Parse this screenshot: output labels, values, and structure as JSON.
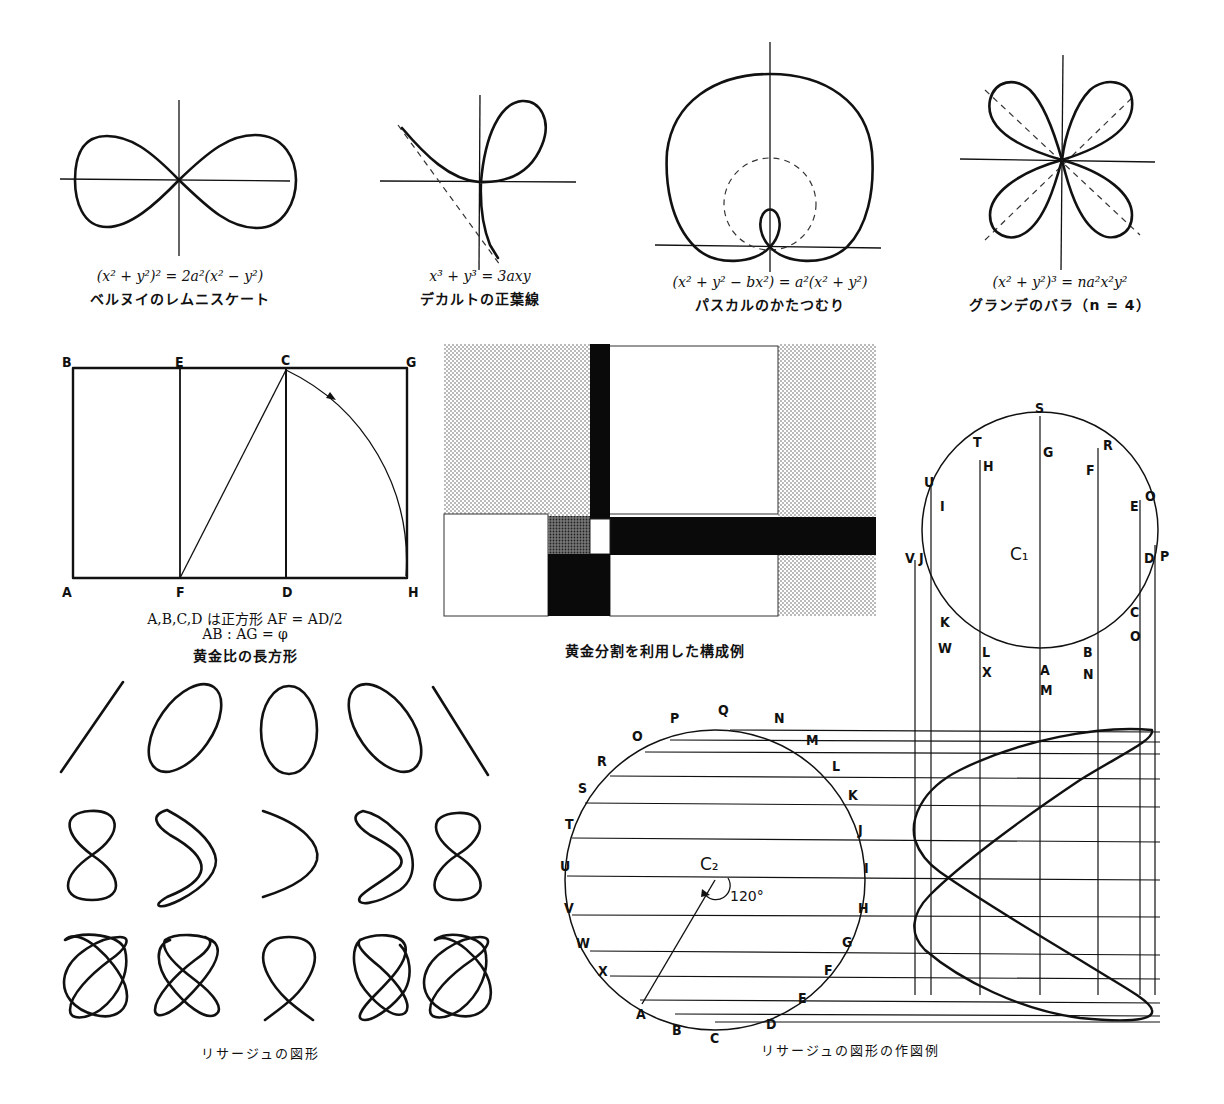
{
  "header": {
    "title_partial": ""
  },
  "curves": [
    {
      "id": "lemniscate",
      "equation": "(x² + y²)² = 2a²(x² − y²)",
      "name": "ベルヌイのレムニスケート"
    },
    {
      "id": "folium",
      "equation": "x³ + y³ = 3axy",
      "name": "デカルトの正葉線"
    },
    {
      "id": "limacon",
      "equation": "(x² + y² − bx²) = a²(x² + y²)",
      "name": "パスカルのかたつむり"
    },
    {
      "id": "rose",
      "equation": "(x² + y²)³ = na²x²y²",
      "name": "グランデのバラ（n = 4）"
    }
  ],
  "golden_rectangle": {
    "points": {
      "A": "A",
      "B": "B",
      "C": "C",
      "D": "D",
      "E": "E",
      "F": "F",
      "G": "G",
      "H": "H"
    },
    "note_line1": "A,B,C,D は正方形 AF = AD/2",
    "note_line2": "AB : AG = φ",
    "caption": "黄金比の長方形"
  },
  "composition": {
    "caption": "黄金分割を利用した構成例"
  },
  "lissajous": {
    "caption": "リサージュの図形"
  },
  "construction": {
    "caption": "リサージュの図形の作図例",
    "c1_label": "C₁",
    "c2_label": "C₂",
    "angle_label": "120°",
    "c1_top_labels": [
      "S",
      "T",
      "U",
      "V",
      "R",
      "O",
      "P"
    ],
    "c1_inner_labels": [
      "G",
      "H",
      "I",
      "J",
      "F",
      "E",
      "D",
      "C",
      "K",
      "L",
      "A",
      "B"
    ],
    "c1_bottom_labels": [
      "W",
      "X",
      "M",
      "N",
      "O"
    ],
    "c2_labels": [
      "O",
      "P",
      "N",
      "M",
      "Q",
      "R",
      "L",
      "S",
      "K",
      "T",
      "J",
      "U",
      "I",
      "V",
      "H",
      "W",
      "G",
      "X",
      "F",
      "A",
      "E",
      "B",
      "D",
      "C"
    ]
  }
}
